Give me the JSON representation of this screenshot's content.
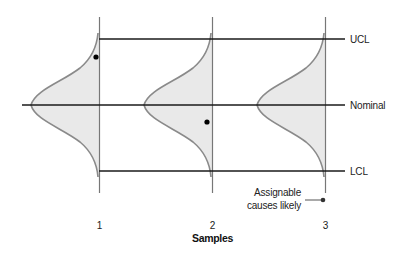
{
  "diagram": {
    "type": "control-chart-process-distributions",
    "colors": {
      "background": "#ffffff",
      "line": "#1a1a1a",
      "curve_stroke": "#8a8a8a",
      "curve_fill": "#e9e9e9",
      "axis_line": "#777777",
      "dot": "#000000"
    },
    "limits": [
      {
        "name": "UCL",
        "label": "UCL"
      },
      {
        "name": "Nominal",
        "label": "Nominal"
      },
      {
        "name": "LCL",
        "label": "LCL"
      }
    ],
    "samples": [
      {
        "label": "1",
        "distribution_shift": "up",
        "point": "above nominal, near UCL"
      },
      {
        "label": "2",
        "distribution_shift": "none",
        "point": "below nominal"
      },
      {
        "label": "3",
        "distribution_shift": "none",
        "point": null
      }
    ],
    "x_axis_title": "Samples",
    "legend": {
      "line1": "Assignable",
      "line2": "causes likely"
    }
  }
}
